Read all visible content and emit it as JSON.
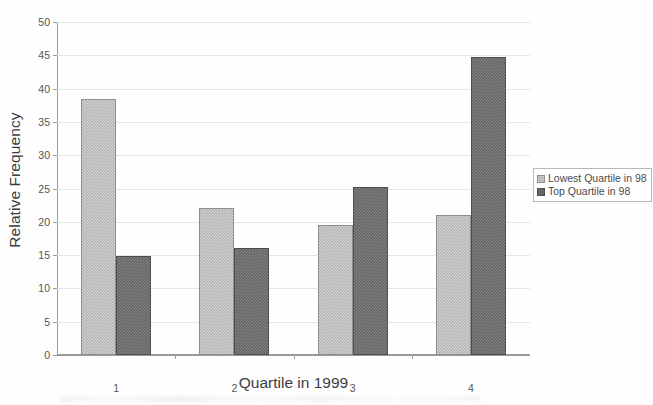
{
  "chart_data": {
    "type": "bar",
    "title": "",
    "xlabel": "Quartile in 1999",
    "ylabel": "Relative Frequency",
    "categories": [
      "1",
      "2",
      "3",
      "4"
    ],
    "series": [
      {
        "name": "Lowest Quartile in 98",
        "color": "#b4b4b4",
        "values": [
          38.5,
          22.0,
          19.5,
          21.0
        ]
      },
      {
        "name": "Top Quartile in 98",
        "color": "#646464",
        "values": [
          14.8,
          16.0,
          25.3,
          44.8
        ]
      }
    ],
    "ylim": [
      0,
      50
    ],
    "y_ticks": [
      0,
      5,
      10,
      15,
      20,
      25,
      30,
      35,
      40,
      45,
      50
    ],
    "y_tick_labels": [
      "0",
      "5",
      "10",
      "15",
      "20",
      "25",
      "30",
      "35",
      "40",
      "45",
      "50"
    ],
    "grid": true,
    "legend_position": "right"
  },
  "legend": {
    "entries": [
      {
        "label": "Lowest Quartile in 98",
        "swatch": "light-gray-checkered-swatch"
      },
      {
        "label": "Top Quartile in 98",
        "swatch": "dark-gray-swatch"
      }
    ]
  }
}
